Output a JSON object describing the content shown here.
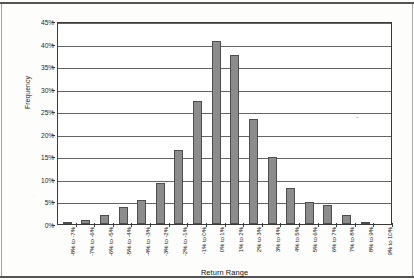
{
  "chart_data": {
    "type": "bar",
    "title": "",
    "xlabel": "Return Range",
    "ylabel": "Frequency",
    "categories": [
      "-8% to -7%",
      "-7% to -6%",
      "-6% to -5%",
      "-5% to -4%",
      "-4% to -3%",
      "-3% to -2%",
      "-2% to -1%",
      "-1% to 0%",
      "0% to 1%",
      "1% to 2%",
      "2% to 3%",
      "3% to 4%",
      "4% to 5%",
      "5% to 6%",
      "6% to 7%",
      "7% to 8%",
      "8% to 9%",
      "9% to 10%"
    ],
    "values": [
      0.3,
      1.0,
      2.1,
      3.7,
      5.3,
      9.1,
      16.3,
      27.3,
      40.5,
      37.4,
      23.2,
      14.9,
      7.9,
      4.9,
      4.2,
      2.1,
      0.5,
      0.0
    ],
    "value_unit": "%",
    "ylim": [
      0,
      45
    ],
    "ytick_labels": [
      "0%",
      "5%",
      "10%",
      "15%",
      "20%",
      "25%",
      "30%",
      "35%",
      "40%",
      "45%"
    ],
    "ytick_values": [
      0,
      5,
      10,
      15,
      20,
      25,
      30,
      35,
      40,
      45
    ],
    "grid": true,
    "legend": false,
    "bar_color": "#8c8c8c",
    "bar_border_color": "#4d4d4d",
    "axis_color": "#3a3a3a",
    "background_color": "#ffffff"
  }
}
